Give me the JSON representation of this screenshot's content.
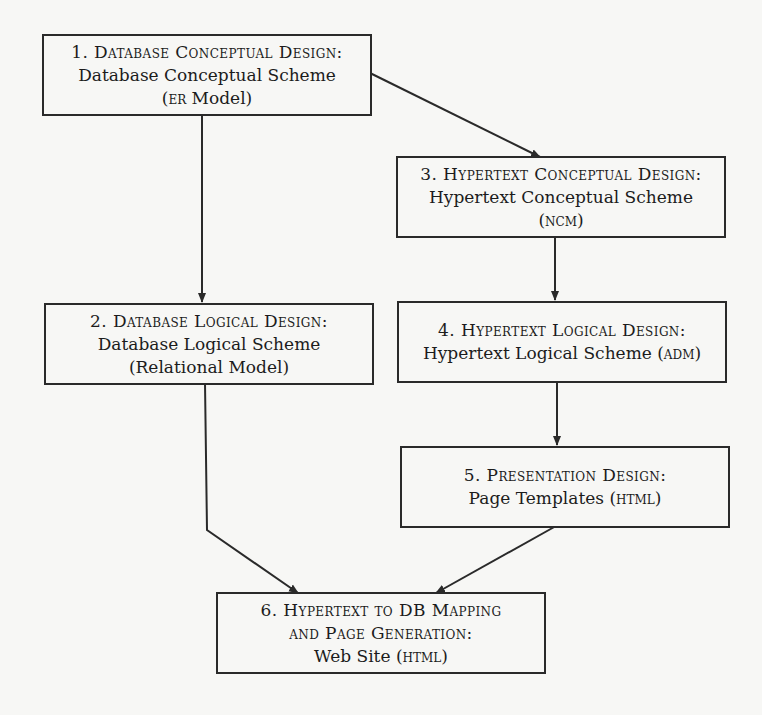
{
  "diagram": {
    "nodes": [
      {
        "id": "1",
        "title": "1. Database Conceptual Design:",
        "subtitle": "Database Conceptual Scheme",
        "note_prefix": "(",
        "note_sc": "ER",
        "note_suffix": " Model)"
      },
      {
        "id": "2",
        "title": "2. Database Logical Design:",
        "subtitle": "Database Logical Scheme",
        "note_prefix": "(Relational Model)",
        "note_sc": "",
        "note_suffix": ""
      },
      {
        "id": "3",
        "title": "3. Hypertext Conceptual Design:",
        "subtitle": "Hypertext Conceptual Scheme",
        "note_prefix": "(",
        "note_sc": "NCM",
        "note_suffix": ")"
      },
      {
        "id": "4",
        "title": "4. Hypertext Logical Design:",
        "subtitle": "Hypertext Logical Scheme (",
        "subtitle_sc": "ADM",
        "subtitle_suffix": ")"
      },
      {
        "id": "5",
        "title": "5. Presentation Design:",
        "subtitle": "Page Templates (",
        "subtitle_sc": "HTML",
        "subtitle_suffix": ")"
      },
      {
        "id": "6",
        "title": "6. Hypertext to DB Mapping",
        "title2": "and Page Generation:",
        "subtitle": "Web Site (",
        "subtitle_sc": "HTML",
        "subtitle_suffix": ")"
      }
    ],
    "edges": [
      {
        "from": "1",
        "to": "2"
      },
      {
        "from": "1",
        "to": "3"
      },
      {
        "from": "3",
        "to": "4"
      },
      {
        "from": "4",
        "to": "5"
      },
      {
        "from": "2",
        "to": "6"
      },
      {
        "from": "5",
        "to": "6"
      }
    ],
    "colors": {
      "line": "#2a2a2a",
      "background": "#f7f7f5"
    }
  }
}
